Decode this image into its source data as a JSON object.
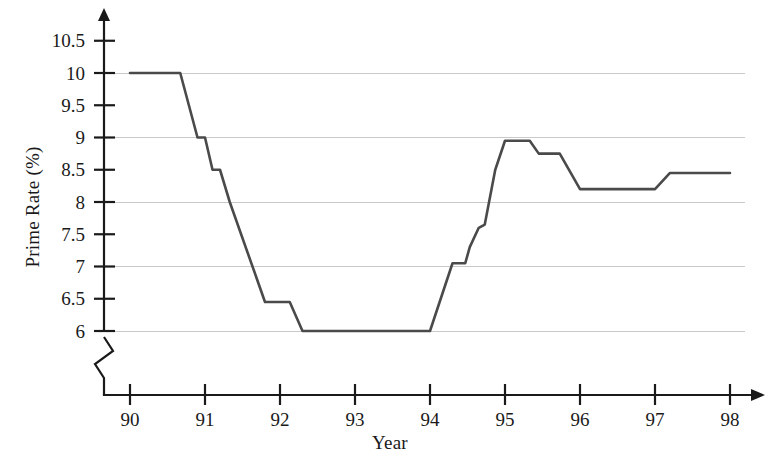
{
  "chart_data": {
    "type": "line",
    "title": "",
    "xlabel": "Year",
    "ylabel": "Prime Rate (%)",
    "x_tick_labels": [
      "90",
      "91",
      "92",
      "93",
      "94",
      "95",
      "96",
      "97",
      "98"
    ],
    "x_tick_values": [
      90,
      91,
      92,
      93,
      94,
      95,
      96,
      97,
      98
    ],
    "y_tick_labels": [
      "6",
      "6.5",
      "7",
      "7.5",
      "8",
      "8.5",
      "9",
      "9.5",
      "10",
      "10.5"
    ],
    "y_tick_values": [
      6,
      6.5,
      7,
      7.5,
      8,
      8.5,
      9,
      9.5,
      10,
      10.5
    ],
    "gridline_values": [
      6,
      7,
      8,
      9,
      10
    ],
    "grid": true,
    "legend": "none",
    "xlim": [
      89.5,
      98.2
    ],
    "ylim": [
      5.75,
      10.8
    ],
    "y_axis_break": true,
    "series": [
      {
        "name": "Prime Rate",
        "color": "#4a4a4a",
        "points": [
          [
            90.0,
            10.0
          ],
          [
            90.67,
            10.0
          ],
          [
            90.9,
            9.0
          ],
          [
            91.0,
            9.0
          ],
          [
            91.1,
            8.5
          ],
          [
            91.2,
            8.5
          ],
          [
            91.33,
            8.0
          ],
          [
            91.8,
            6.45
          ],
          [
            92.13,
            6.45
          ],
          [
            92.3,
            6.0
          ],
          [
            94.0,
            6.0
          ],
          [
            94.3,
            7.05
          ],
          [
            94.47,
            7.05
          ],
          [
            94.53,
            7.3
          ],
          [
            94.65,
            7.6
          ],
          [
            94.73,
            7.65
          ],
          [
            94.87,
            8.5
          ],
          [
            95.0,
            8.95
          ],
          [
            95.33,
            8.95
          ],
          [
            95.45,
            8.75
          ],
          [
            95.73,
            8.75
          ],
          [
            96.0,
            8.2
          ],
          [
            97.0,
            8.2
          ],
          [
            97.2,
            8.45
          ],
          [
            98.0,
            8.45
          ]
        ]
      }
    ]
  },
  "axes": {
    "y_axis_name": "prime-rate-axis",
    "x_axis_name": "year-axis"
  }
}
